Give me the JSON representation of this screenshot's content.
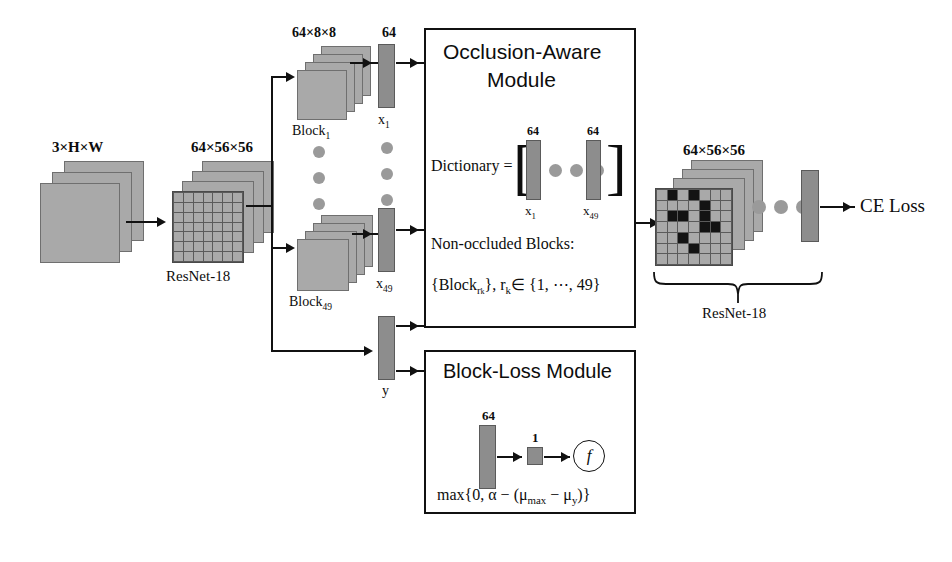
{
  "figure": {
    "accent_gray": "#a9a9a9",
    "vector_gray": "#8d8d8d",
    "occluded_color": "#131313",
    "line_color": "#111111"
  },
  "input_stage": {
    "shape_label": "3×H×W",
    "backbone_label": "ResNet-18",
    "feature_shape_label": "64×56×56",
    "grid_rows": 7,
    "grid_cols": 7
  },
  "blocks_column": {
    "block_shape_label": "64×8×8",
    "first_block_label": "Block",
    "first_block_sub": "1",
    "last_block_label": "Block",
    "last_block_sub": "49",
    "ellipsis_dots": 3
  },
  "vectors_column": {
    "dim_label": "64",
    "first_vector_label": "x",
    "first_vector_sub": "1",
    "last_vector_label": "x",
    "last_vector_sub": "49",
    "target_vector_label": "y",
    "ellipsis_dots": 3
  },
  "occlusion_module": {
    "title_line1": "Occlusion-Aware",
    "title_line2": "Module",
    "dictionary_label": "Dictionary =",
    "bracket_open": "[",
    "bracket_close": "]",
    "dict_dim_left": "64",
    "dict_dim_right": "64",
    "dict_first_label": "x",
    "dict_first_sub": "1",
    "dict_last_label": "x",
    "dict_last_sub": "49",
    "dict_dots": 3,
    "nonoccluded_heading": "Non-occluded Blocks:",
    "nonoccluded_set": "{Block",
    "nonoccluded_set_sub": "r",
    "nonoccluded_set_sub2": "k",
    "nonoccluded_set_tail": "}, r",
    "nonoccluded_tail2": "∈ {1, ⋯, 49}"
  },
  "blockloss_module": {
    "title": "Block-Loss Module",
    "vector_dim_label": "64",
    "scalar_dim_label": "1",
    "function_glyph": "f",
    "formula_prefix": "max{0, α − (μ",
    "formula_sub1": "max",
    "formula_mid": " − μ",
    "formula_sub2": "y",
    "formula_suffix": ")}"
  },
  "output_stage": {
    "feature_shape_label": "64×56×56",
    "backbone_label": "ResNet-18",
    "loss_label": "CE Loss",
    "ellipsis_dots": 3,
    "grid_rows": 7,
    "grid_cols": 7,
    "occluded_cells": [
      [
        0,
        1
      ],
      [
        0,
        3
      ],
      [
        1,
        4
      ],
      [
        2,
        1
      ],
      [
        2,
        2
      ],
      [
        2,
        4
      ],
      [
        3,
        4
      ],
      [
        3,
        5
      ],
      [
        4,
        2
      ],
      [
        5,
        3
      ]
    ]
  }
}
